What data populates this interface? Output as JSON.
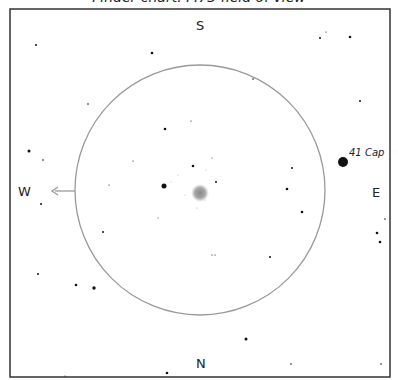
{
  "chart": {
    "title_partial": "Finder chart: M73 field of view",
    "directions": {
      "top": "S",
      "bottom": "N",
      "left": "W",
      "right": "E"
    },
    "frame": {
      "x": 10,
      "y": 9,
      "width": 380,
      "height": 368,
      "stroke": "#333333"
    },
    "field_circle": {
      "cx": 200,
      "cy": 190,
      "r": 125,
      "stroke": "#999999"
    },
    "motion_arrow": {
      "direction": "west",
      "from_x": 75,
      "to_x": 52,
      "y": 191,
      "color": "#9a9a9a"
    },
    "target": {
      "name": "cluster-glow",
      "cx": 200,
      "cy": 193,
      "r": 7,
      "color": "#8a8a8a"
    },
    "labels": [
      {
        "text": "41 Cap",
        "x": 349,
        "y": 148
      }
    ],
    "stars": [
      {
        "x": 36,
        "y": 45,
        "r": 1.0
      },
      {
        "x": 152,
        "y": 53,
        "r": 1.3
      },
      {
        "x": 320,
        "y": 38,
        "r": 1.0
      },
      {
        "x": 326,
        "y": 32,
        "r": 0.6
      },
      {
        "x": 350,
        "y": 37,
        "r": 1.3
      },
      {
        "x": 88,
        "y": 104,
        "r": 0.8
      },
      {
        "x": 253,
        "y": 79,
        "r": 0.8
      },
      {
        "x": 360,
        "y": 101,
        "r": 1.0
      },
      {
        "x": 165,
        "y": 129,
        "r": 1.3
      },
      {
        "x": 191,
        "y": 121,
        "r": 0.6
      },
      {
        "x": 29,
        "y": 151,
        "r": 1.5
      },
      {
        "x": 43,
        "y": 160,
        "r": 0.8
      },
      {
        "x": 133,
        "y": 161,
        "r": 0.6
      },
      {
        "x": 193,
        "y": 166,
        "r": 1.3
      },
      {
        "x": 212,
        "y": 158,
        "r": 0.5
      },
      {
        "x": 292,
        "y": 168,
        "r": 1.0
      },
      {
        "x": 343,
        "y": 162,
        "r": 5.0
      },
      {
        "x": 164,
        "y": 186,
        "r": 2.5
      },
      {
        "x": 109,
        "y": 185,
        "r": 0.6
      },
      {
        "x": 216,
        "y": 182,
        "r": 1.0
      },
      {
        "x": 287,
        "y": 189,
        "r": 1.3
      },
      {
        "x": 41,
        "y": 204,
        "r": 1.0
      },
      {
        "x": 302,
        "y": 212,
        "r": 1.3
      },
      {
        "x": 385,
        "y": 219,
        "r": 0.8
      },
      {
        "x": 377,
        "y": 233,
        "r": 1.3
      },
      {
        "x": 380,
        "y": 242,
        "r": 1.3
      },
      {
        "x": 103,
        "y": 232,
        "r": 1.0
      },
      {
        "x": 158,
        "y": 218,
        "r": 0.5
      },
      {
        "x": 212,
        "y": 255,
        "r": 0.6
      },
      {
        "x": 215,
        "y": 255,
        "r": 0.6
      },
      {
        "x": 270,
        "y": 257,
        "r": 1.0
      },
      {
        "x": 38,
        "y": 274,
        "r": 1.0
      },
      {
        "x": 76,
        "y": 285,
        "r": 1.3
      },
      {
        "x": 94,
        "y": 288,
        "r": 1.7
      },
      {
        "x": 246,
        "y": 339,
        "r": 1.5
      },
      {
        "x": 167,
        "y": 373,
        "r": 1.3
      },
      {
        "x": 291,
        "y": 364,
        "r": 0.8
      },
      {
        "x": 381,
        "y": 364,
        "r": 0.8
      },
      {
        "x": 65,
        "y": 376,
        "r": 0.6
      }
    ],
    "faint_stars": [
      {
        "x": 171,
        "y": 182,
        "r": 0.5
      },
      {
        "x": 206,
        "y": 170,
        "r": 0.5
      },
      {
        "x": 185,
        "y": 195,
        "r": 0.5
      },
      {
        "x": 197,
        "y": 208,
        "r": 0.5
      },
      {
        "x": 205,
        "y": 200,
        "r": 0.5
      },
      {
        "x": 178,
        "y": 175,
        "r": 0.5
      }
    ]
  }
}
